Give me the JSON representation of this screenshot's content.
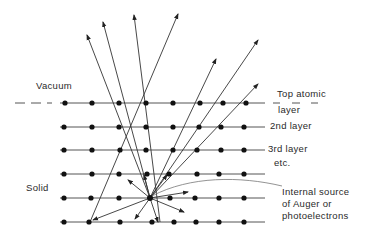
{
  "diagram": {
    "labels": {
      "vacuum": "Vacuum",
      "solid": "Solid",
      "top_layer_1": "Top atomic",
      "top_layer_2": "layer",
      "second_layer": "2nd layer",
      "third_layer": "3rd layer",
      "etc": "etc.",
      "source_1": "Internal source",
      "source_2": "of Auger  or",
      "source_3": "photoelectrons"
    },
    "layers": 6,
    "atoms_per_layer": 8,
    "colors": {
      "line": "#444444",
      "dot": "#111111",
      "text": "#2a2a2a"
    }
  }
}
